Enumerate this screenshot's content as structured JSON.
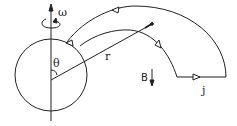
{
  "diagram": {
    "labels": {
      "omega": "ω",
      "theta": "θ",
      "radius": "r",
      "field": "B",
      "current": "j"
    },
    "colors": {
      "stroke": "#222222",
      "background": "#ffffff"
    }
  }
}
